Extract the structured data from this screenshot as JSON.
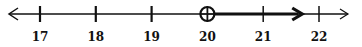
{
  "number_line": {
    "min": 17,
    "max": 22,
    "ticks": [
      {
        "value": 17,
        "label": "17"
      },
      {
        "value": 18,
        "label": "18"
      },
      {
        "value": 19,
        "label": "19"
      },
      {
        "value": 20,
        "label": "20"
      },
      {
        "value": 21,
        "label": "21"
      },
      {
        "value": 22,
        "label": "22"
      }
    ],
    "point": {
      "value": 20,
      "style": "open-circle-with-cross"
    },
    "ray": {
      "from": 20,
      "to": 21.7,
      "direction": "right"
    },
    "line_color": "#111111"
  }
}
